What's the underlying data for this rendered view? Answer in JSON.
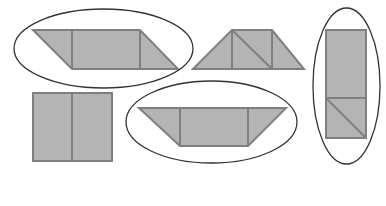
{
  "diagram": {
    "title": "",
    "colors": {
      "background": "#ffffff",
      "shape_fill": "#b4b4b4",
      "shape_stroke": "#7f7f7f",
      "ellipse_stroke": "#333333"
    },
    "ellipses": [
      {
        "id": "ellipse-parallelogram",
        "cx": 103.5,
        "cy": 48.5,
        "rx": 89.5,
        "ry": 39.5
      },
      {
        "id": "ellipse-inverted-trapezoid",
        "cx": 211.5,
        "cy": 122,
        "rx": 85.5,
        "ry": 41
      },
      {
        "id": "ellipse-vertical-rectangle",
        "cx": 346.5,
        "cy": 86,
        "rx": 33.5,
        "ry": 78
      }
    ],
    "shapes": [
      {
        "id": "parallelogram",
        "outline": "33,30 140,30 178,69 72,69",
        "inner_lines": [
          [
            72,
            30,
            72,
            69
          ],
          [
            140,
            30,
            140,
            69
          ]
        ]
      },
      {
        "id": "trapezoid",
        "outline": "232,30 272,30 304,69 193,69",
        "inner_lines": [
          [
            232,
            30,
            232,
            69
          ],
          [
            272,
            30,
            272,
            69
          ],
          [
            232,
            30,
            272,
            69
          ]
        ]
      },
      {
        "id": "vertical-rectangle",
        "outline": "326,30 366,30 366,138 326,138",
        "inner_lines": [
          [
            326,
            98,
            366,
            98
          ],
          [
            326,
            98,
            366,
            138
          ]
        ]
      },
      {
        "id": "square",
        "outline": "33,93 112,93 112,161 33,161",
        "inner_lines": [
          [
            72,
            93,
            72,
            161
          ]
        ]
      },
      {
        "id": "inverted-trapezoid",
        "outline": "139,108 286,108 248,146 180,146",
        "inner_lines": [
          [
            180,
            108,
            180,
            146
          ],
          [
            248,
            108,
            248,
            146
          ]
        ]
      }
    ]
  }
}
